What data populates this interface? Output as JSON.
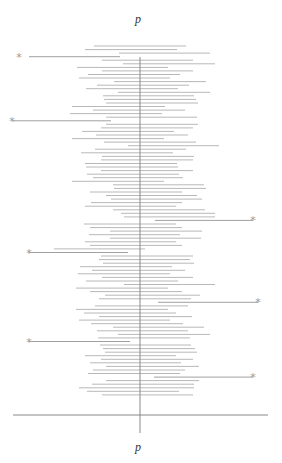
{
  "chart_data": {
    "type": "interval",
    "title": "p",
    "xlabel": "p",
    "axis_color": "#888888",
    "bar_color": "#b8b8b8",
    "outlier_bar_color": "#a0a0a0",
    "marker_color": "#9a9a9a",
    "marker_glyph": "*",
    "center_x": 140,
    "baseline": {
      "y": 415,
      "x1": 13,
      "x2": 268
    },
    "vaxis": {
      "y1": 57,
      "y2": 433
    },
    "row_start_y": 46,
    "row_spacing": 3.56,
    "intervals": [
      [
        94,
        186
      ],
      [
        85,
        177
      ],
      [
        119,
        210
      ],
      [
        29,
        120
      ],
      [
        102,
        193
      ],
      [
        123,
        215
      ],
      [
        77,
        168
      ],
      [
        102,
        193
      ],
      [
        88,
        180
      ],
      [
        79,
        170
      ],
      [
        114,
        206
      ],
      [
        97,
        189
      ],
      [
        86,
        178
      ],
      [
        118,
        210
      ],
      [
        103,
        194
      ],
      [
        104,
        196
      ],
      [
        106,
        198
      ],
      [
        72,
        165
      ],
      [
        93,
        185
      ],
      [
        70,
        162
      ],
      [
        106,
        197
      ],
      [
        12,
        111
      ],
      [
        106,
        198
      ],
      [
        101,
        193
      ],
      [
        82,
        174
      ],
      [
        96,
        188
      ],
      [
        72,
        164
      ],
      [
        104,
        196
      ],
      [
        128,
        219
      ],
      [
        95,
        186
      ],
      [
        81,
        173
      ],
      [
        102,
        194
      ],
      [
        101,
        193
      ],
      [
        85,
        177
      ],
      [
        86,
        178
      ],
      [
        101,
        193
      ],
      [
        87,
        179
      ],
      [
        93,
        183
      ],
      [
        72,
        164
      ],
      [
        113,
        204
      ],
      [
        114,
        206
      ],
      [
        90,
        182
      ],
      [
        106,
        197
      ],
      [
        111,
        202
      ],
      [
        91,
        182
      ],
      [
        85,
        176
      ],
      [
        113,
        205
      ],
      [
        121,
        215
      ],
      [
        124,
        215
      ],
      [
        155,
        253
      ],
      [
        84,
        176
      ],
      [
        90,
        182
      ],
      [
        110,
        202
      ],
      [
        89,
        180
      ],
      [
        110,
        201
      ],
      [
        85,
        176
      ],
      [
        90,
        182
      ],
      [
        54,
        145
      ],
      [
        29,
        128
      ],
      [
        101,
        193
      ],
      [
        99,
        190
      ],
      [
        103,
        194
      ],
      [
        80,
        172
      ],
      [
        92,
        185
      ],
      [
        78,
        170
      ],
      [
        102,
        193
      ],
      [
        86,
        178
      ],
      [
        124,
        215
      ],
      [
        76,
        168
      ],
      [
        90,
        182
      ],
      [
        105,
        200
      ],
      [
        99,
        191
      ],
      [
        158,
        258
      ],
      [
        95,
        188
      ],
      [
        76,
        168
      ],
      [
        84,
        176
      ],
      [
        99,
        192
      ],
      [
        79,
        170
      ],
      [
        91,
        183
      ],
      [
        113,
        204
      ],
      [
        97,
        188
      ],
      [
        118,
        210
      ],
      [
        98,
        190
      ],
      [
        29,
        130
      ],
      [
        100,
        191
      ],
      [
        103,
        195
      ],
      [
        105,
        197
      ],
      [
        85,
        176
      ],
      [
        101,
        193
      ],
      [
        90,
        181
      ],
      [
        106,
        199
      ],
      [
        93,
        185
      ],
      [
        88,
        180
      ],
      [
        154,
        253
      ],
      [
        106,
        199
      ],
      [
        92,
        194
      ],
      [
        79,
        194
      ],
      [
        87,
        179
      ],
      [
        102,
        193
      ]
    ],
    "outliers": [
      {
        "row": 3,
        "x": 19,
        "side": "left"
      },
      {
        "row": 21,
        "x": 12,
        "side": "left"
      },
      {
        "row": 49,
        "x": 253,
        "side": "right"
      },
      {
        "row": 58,
        "x": 29,
        "side": "left"
      },
      {
        "row": 72,
        "x": 258,
        "side": "right"
      },
      {
        "row": 83,
        "x": 29,
        "side": "left"
      },
      {
        "row": 93,
        "x": 253,
        "side": "right"
      }
    ]
  },
  "labels": {
    "top": "p",
    "bottom": "p"
  }
}
